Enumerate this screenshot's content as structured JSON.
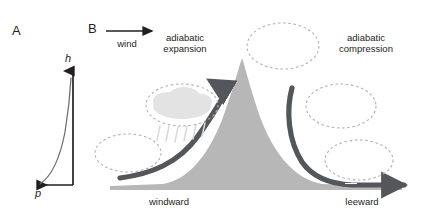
{
  "figure": {
    "background_color": "#ffffff",
    "width": 429,
    "height": 221
  },
  "panel_a": {
    "label": "A",
    "y_axis_label": "h",
    "x_axis_label": "p",
    "axis_color": "#231f20",
    "curve_color": "#58595b",
    "description_type": "exponential-pressure-height-curve"
  },
  "panel_b": {
    "label": "B",
    "wind_label": "wind",
    "wind_arrow_color": "#231f20",
    "left_caption": "adiabatic\nexpansion",
    "left_caption_line1": "adiabatic",
    "left_caption_line2": "expansion",
    "right_caption_line1": "adiabatic",
    "right_caption_line2": "compression",
    "windward_label": "windward",
    "leeward_label": "leeward",
    "mountain_color": "#b7b7b7",
    "airflow_arrow_color": "#53565a",
    "parcel_outline_color": "#b9a9b4",
    "cloud_fill_color": "#e3e3e3",
    "rain_color": "#d8d8d8",
    "parcels": [
      {
        "name": "parcel-upwind-low",
        "cx": 128,
        "cy": 153,
        "rx": 33,
        "ry": 19,
        "has_cloud": false
      },
      {
        "name": "parcel-windward-cloud",
        "cx": 182,
        "cy": 105,
        "rx": 36,
        "ry": 21,
        "has_cloud": true
      },
      {
        "name": "parcel-summit",
        "cx": 283,
        "cy": 46,
        "rx": 36,
        "ry": 23,
        "has_cloud": false
      },
      {
        "name": "parcel-leeward-upper",
        "cx": 341,
        "cy": 106,
        "rx": 35,
        "ry": 22,
        "has_cloud": false
      },
      {
        "name": "parcel-leeward-low",
        "cx": 359,
        "cy": 160,
        "rx": 34,
        "ry": 20,
        "has_cloud": false
      }
    ]
  }
}
